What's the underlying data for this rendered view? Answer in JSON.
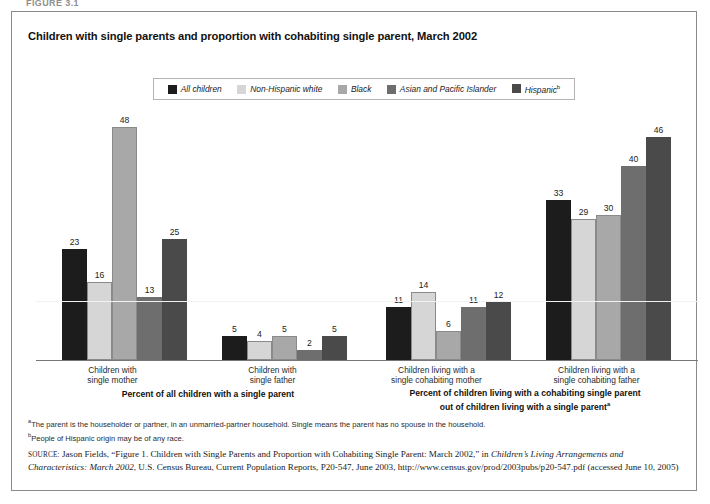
{
  "figure_label": "FIGURE 3.1",
  "title": "Children with single parents and proportion with cohabiting single parent, March 2002",
  "legend": {
    "items": [
      {
        "label": "All children",
        "color": "#1c1c1c",
        "marker": ""
      },
      {
        "label": "Non-Hispanic white",
        "color": "#d6d6d6",
        "marker": ""
      },
      {
        "label": "Black",
        "color": "#a8a8a8",
        "marker": ""
      },
      {
        "label": "Asian and Pacific Islander",
        "color": "#6e6e6e",
        "marker": ""
      },
      {
        "label": "Hispanic",
        "color": "#4a4a4a",
        "marker": "b"
      }
    ]
  },
  "chart_data": {
    "type": "bar",
    "title": "Children with single parents and proportion with cohabiting single parent, March 2002",
    "xlabel": "",
    "ylabel": "",
    "ylim": [
      0,
      52
    ],
    "grid": false,
    "legend_position": "top",
    "categories": [
      "Children with single mother",
      "Children with single father",
      "Children living with a single cohabiting mother",
      "Children living with a single cohabiting father"
    ],
    "series": [
      {
        "name": "All children",
        "color": "#1c1c1c",
        "values": [
          23,
          5,
          11,
          33
        ]
      },
      {
        "name": "Non-Hispanic white",
        "color": "#d6d6d6",
        "values": [
          16,
          4,
          14,
          29
        ]
      },
      {
        "name": "Black",
        "color": "#a8a8a8",
        "values": [
          48,
          5,
          6,
          30
        ]
      },
      {
        "name": "Asian and Pacific Islander",
        "color": "#6e6e6e",
        "values": [
          13,
          2,
          11,
          40
        ]
      },
      {
        "name": "Hispanic",
        "color": "#4a4a4a",
        "values": [
          25,
          5,
          12,
          46
        ]
      }
    ],
    "annotations": [
      "Percent of all children with a single parent",
      "Percent of children living with a cohabiting single parent out of children living with a single parent"
    ]
  },
  "axis_labels": [
    {
      "line1": "Children with",
      "line2": "single mother"
    },
    {
      "line1": "Children with",
      "line2": "single father"
    },
    {
      "line1": "Children living with a",
      "line2": "single cohabiting mother"
    },
    {
      "line1": "Children living with a",
      "line2": "single cohabiting father"
    }
  ],
  "panel_labels": [
    {
      "line1": "Percent of all children with a single parent",
      "line2": "",
      "marker": ""
    },
    {
      "line1": "Percent of children living with a cohabiting single parent",
      "line2": "out of children living with a single parent",
      "marker": "a"
    }
  ],
  "notes": [
    {
      "marker": "a",
      "text": "The parent is the householder or partner, in an unmarried-partner household. Single means the parent has no spouse in the household."
    },
    {
      "marker": "b",
      "text": "People of Hispanic origin may be of any race."
    }
  ],
  "source": {
    "prefix": "SOURCE:",
    "part1": " Jason Fields, “Figure 1. Children with Single Parents and Proportion with Cohabiting Single Parent: March 2002,” in ",
    "italic1": "Children’s Living Arrangements and Characteristics: March 2002",
    "part2": ", U.S. Census Bureau, Current Population Reports, P20-547, June 2003, http://www.census.gov/prod/2003pubs/p20-547.pdf (accessed June 10, 2005)"
  }
}
